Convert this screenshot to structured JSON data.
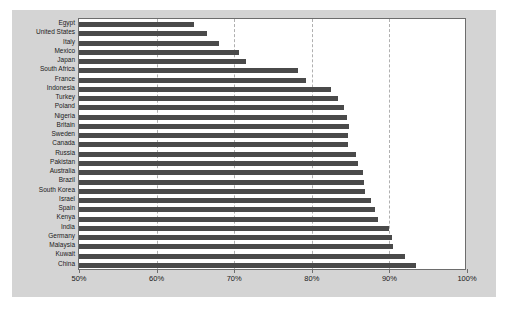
{
  "chart_data": {
    "type": "bar",
    "orientation": "horizontal",
    "title": "",
    "subtitle": "",
    "xlabel": "",
    "ylabel": "",
    "xlim": [
      50,
      100
    ],
    "ylim": null,
    "grid": true,
    "legend": null,
    "legend_position": "none",
    "xticks": [
      50,
      60,
      70,
      80,
      90,
      100
    ],
    "xtick_labels": [
      "50%",
      "60%",
      "70%",
      "80%",
      "90%",
      "100%"
    ],
    "categories": [
      "Egypt",
      "United States",
      "Italy",
      "Mexico",
      "Japan",
      "South Africa",
      "France",
      "Indonesia",
      "Turkey",
      "Poland",
      "Nigeria",
      "Britain",
      "Sweden",
      "Canada",
      "Russia",
      "Pakistan",
      "Australia",
      "Brazil",
      "South Korea",
      "Israel",
      "Spain",
      "Kenya",
      "India",
      "Germany",
      "Malaysia",
      "Kuwait",
      "China"
    ],
    "values": [
      64.8,
      66.5,
      68.0,
      70.6,
      71.5,
      78.2,
      79.2,
      82.5,
      83.4,
      84.2,
      84.5,
      84.8,
      84.7,
      84.7,
      85.7,
      86.0,
      86.6,
      86.7,
      86.9,
      87.6,
      88.2,
      88.5,
      90.0,
      90.3,
      90.5,
      92.0,
      93.4
    ],
    "bar_color": "#4a4a4a",
    "plot_background": "#ffffff",
    "figure_background": "#d4d4d4",
    "grid_color": "#b0b0b0",
    "axis_color": "#6d6d6d"
  }
}
